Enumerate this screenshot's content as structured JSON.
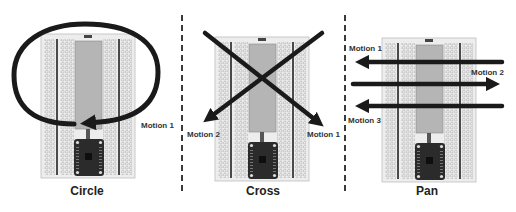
{
  "panels": [
    {
      "id": "circle",
      "title": "Circle",
      "motions": [
        {
          "label": "Motion 1",
          "shape": "clockwise-loop-arrow"
        }
      ]
    },
    {
      "id": "cross",
      "title": "Cross",
      "motions": [
        {
          "label": "Motion 1",
          "shape": "diagonal-arrow-top-left-to-bottom-right"
        },
        {
          "label": "Motion 2",
          "shape": "diagonal-arrow-top-right-to-bottom-left"
        }
      ]
    },
    {
      "id": "pan",
      "title": "Pan",
      "motions": [
        {
          "label": "Motion 1",
          "shape": "horizontal-arrow-right-to-left"
        },
        {
          "label": "Motion 2",
          "shape": "horizontal-arrow-left-to-right"
        },
        {
          "label": "Motion 3",
          "shape": "horizontal-arrow-right-to-left"
        }
      ]
    }
  ],
  "colors": {
    "arrow": "#1a1a1a",
    "breadboard": "#ececec",
    "breadboard_center": "#b5b5b5",
    "rail": "#4a4a4a",
    "board": "#2b2b2b",
    "divider": "#3a3a3a"
  }
}
